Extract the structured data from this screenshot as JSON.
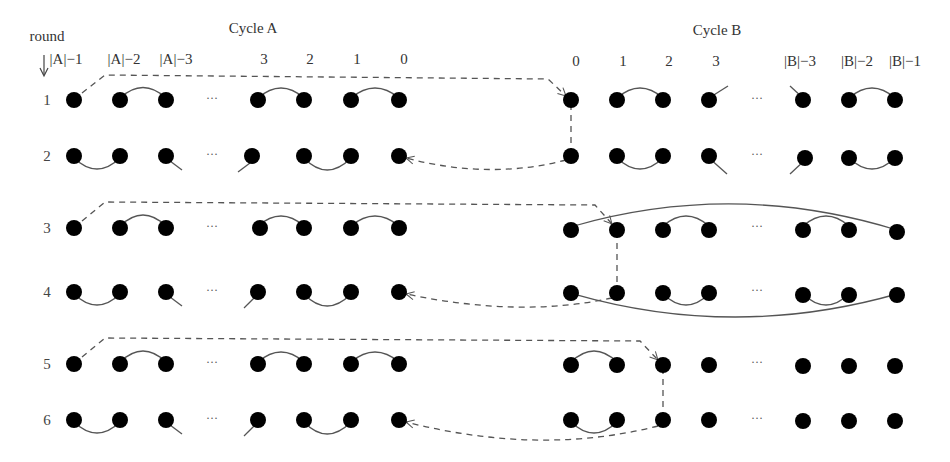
{
  "diagram": {
    "axis_label": "round",
    "cycle_a": {
      "title": "Cycle A",
      "node_labels": [
        "|A|−1",
        "|A|−2",
        "|A|−3",
        "3",
        "2",
        "1",
        "0"
      ]
    },
    "cycle_b": {
      "title": "Cycle B",
      "node_labels": [
        "0",
        "1",
        "2",
        "3",
        "|B|−3",
        "|B|−2",
        "|B|−1"
      ]
    },
    "rounds": [
      "1",
      "2",
      "3",
      "4",
      "5",
      "6"
    ],
    "ellipsis": "···",
    "colors": {
      "node": "#000000",
      "edge": "#555555",
      "dashed": "#555555"
    }
  }
}
